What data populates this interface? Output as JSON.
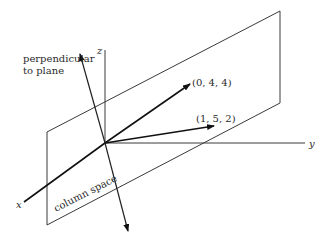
{
  "diagram": {
    "type": "3d-vector-diagram",
    "axes": {
      "x": {
        "label": "x"
      },
      "y": {
        "label": "y"
      },
      "z": {
        "label": "z"
      }
    },
    "plane": {
      "label": "column space"
    },
    "normal": {
      "label_line1": "perpendicular",
      "label_line2": "to plane"
    },
    "vectors": [
      {
        "label": "(0, 4, 4)"
      },
      {
        "label": "(1, 5, 2)"
      }
    ],
    "colors": {
      "ink": "#111111",
      "line": "#3a3a3a",
      "background": "#ffffff"
    }
  }
}
